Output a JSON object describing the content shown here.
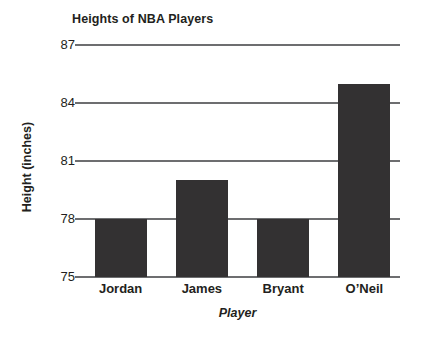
{
  "chart_data": {
    "type": "bar",
    "title": "Heights of NBA Players",
    "xlabel": "Player",
    "ylabel": "Height (inches)",
    "categories": [
      "Jordan",
      "James",
      "Bryant",
      "O’Neil"
    ],
    "values": [
      78,
      80,
      78,
      85
    ],
    "ylim": [
      75,
      87
    ],
    "yticks": [
      75,
      78,
      81,
      84,
      87
    ],
    "ytick_labels": [
      "75",
      "78",
      "81",
      "84",
      "87"
    ],
    "grid": true,
    "legend": null,
    "bar_color": "#333132",
    "gridline_color": "#6d6e70",
    "background_color": "#ffffff"
  },
  "axis": {
    "y_ticks": [
      {
        "label": "87",
        "value": 87
      },
      {
        "label": "84",
        "value": 84
      },
      {
        "label": "81",
        "value": 81
      },
      {
        "label": "78",
        "value": 78
      },
      {
        "label": "75",
        "value": 75
      }
    ],
    "x_ticks": [
      {
        "label": "Jordan"
      },
      {
        "label": "James"
      },
      {
        "label": "Bryant"
      },
      {
        "label": "O’Neil"
      }
    ]
  },
  "bars": [
    {
      "name": "Jordan",
      "value": 78
    },
    {
      "name": "James",
      "value": 80
    },
    {
      "name": "Bryant",
      "value": 78
    },
    {
      "name": "O’Neil",
      "value": 85
    }
  ]
}
